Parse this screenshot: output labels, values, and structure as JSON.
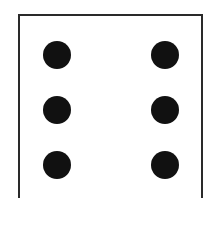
{
  "die": {
    "face_value": 6,
    "border_color": "#2a2a2a",
    "pip_color": "#111111",
    "pips": [
      {
        "x": 57,
        "y": 55
      },
      {
        "x": 165,
        "y": 55
      },
      {
        "x": 57,
        "y": 110
      },
      {
        "x": 165,
        "y": 110
      },
      {
        "x": 57,
        "y": 165
      },
      {
        "x": 165,
        "y": 165
      }
    ]
  }
}
